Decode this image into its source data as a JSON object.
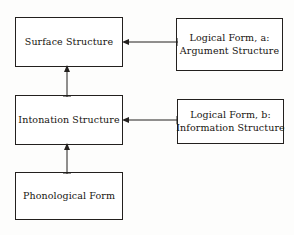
{
  "diagram": {
    "type": "block-flow-diagram",
    "background_color": "#fdfdfc",
    "line_color": "#23201e",
    "text_color": "#17140f",
    "nodes": [
      {
        "id": "surface-structure",
        "lines": [
          "Surface Structure"
        ],
        "line1": "Surface Structure",
        "column": "left",
        "row": 1
      },
      {
        "id": "intonation-structure",
        "lines": [
          "Intonation Structure"
        ],
        "line1": "Intonation Structure",
        "column": "left",
        "row": 2
      },
      {
        "id": "phonological-form",
        "lines": [
          "Phonological Form"
        ],
        "line1": "Phonological Form",
        "column": "left",
        "row": 3
      },
      {
        "id": "logical-form-a",
        "lines": [
          "Logical Form, a:",
          "Argument Structure"
        ],
        "line1": "Logical Form, a:",
        "line2": "Argument Structure",
        "column": "right",
        "row": 1
      },
      {
        "id": "logical-form-b",
        "lines": [
          "Logical Form, b:",
          "Information Structure"
        ],
        "line1": "Logical Form, b:",
        "line2": "Information Structure",
        "column": "right",
        "row": 2
      }
    ],
    "edges": [
      {
        "id": "lf-a-to-surface",
        "from": "logical-form-a",
        "to": "surface-structure",
        "orientation": "horizontal",
        "direction": "left",
        "arrowheads": "single",
        "label": ""
      },
      {
        "id": "lf-b-to-intonation",
        "from": "logical-form-b",
        "to": "intonation-structure",
        "orientation": "horizontal",
        "direction": "left",
        "arrowheads": "single",
        "label": ""
      },
      {
        "id": "intonation-to-surface",
        "from": "intonation-structure",
        "to": "surface-structure",
        "orientation": "vertical",
        "direction": "up",
        "arrowheads": "single",
        "label": ""
      },
      {
        "id": "phonological-to-intonation",
        "from": "phonological-form",
        "to": "intonation-structure",
        "orientation": "vertical",
        "direction": "up",
        "arrowheads": "single",
        "label": ""
      }
    ]
  }
}
